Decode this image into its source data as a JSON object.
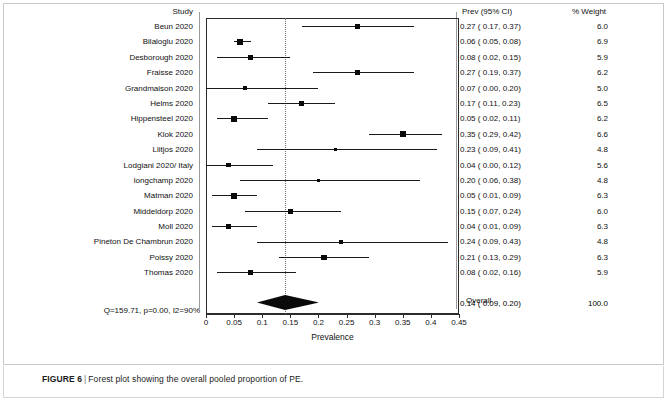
{
  "figure": {
    "caption_label": "FIGURE 6",
    "caption_separator": "|",
    "caption_text": "Forest plot showing the overall pooled proportion of PE."
  },
  "headers": {
    "study": "Study",
    "estimate": "Prev (95% CI)",
    "weight": "% Weight"
  },
  "overall": {
    "label": "Overall",
    "heterogeneity": "Q=159.71, p=0.00, I2=90%",
    "estimate_text": "0.14 (  0.09,  0.20)",
    "weight_text": "100.0"
  },
  "chart_data": {
    "type": "forest",
    "title": "Forest plot showing the overall pooled proportion of PE.",
    "xlabel": "Prevalence",
    "ylabel": "",
    "xlim": [
      0,
      0.45
    ],
    "xticks": [
      0,
      0.05,
      0.1,
      0.15,
      0.2,
      0.25,
      0.3,
      0.35,
      0.4,
      0.45
    ],
    "xticklabels": [
      "0",
      "0.05",
      "0.1",
      "0.15",
      "0.2",
      "0.25",
      "0.3",
      "0.35",
      "0.4",
      "0.45"
    ],
    "grid": false,
    "reference_line": 0.14,
    "effect_measure": "Prevalence",
    "studies": [
      {
        "label": "Beun 2020",
        "estimate": 0.27,
        "ci_low": 0.17,
        "ci_high": 0.37,
        "weight": 6.0,
        "estimate_text": "0.27 (  0.17,  0.37)",
        "weight_text": "6.0"
      },
      {
        "label": "Bilaloglu 2020",
        "estimate": 0.06,
        "ci_low": 0.05,
        "ci_high": 0.08,
        "weight": 6.9,
        "estimate_text": "0.06 (  0.05,  0.08)",
        "weight_text": "6.9"
      },
      {
        "label": "Desborough 2020",
        "estimate": 0.08,
        "ci_low": 0.02,
        "ci_high": 0.15,
        "weight": 5.9,
        "estimate_text": "0.08 (  0.02,  0.15)",
        "weight_text": "5.9"
      },
      {
        "label": "Fraisse 2020",
        "estimate": 0.27,
        "ci_low": 0.19,
        "ci_high": 0.37,
        "weight": 6.2,
        "estimate_text": "0.27 (  0.19,  0.37)",
        "weight_text": "6.2"
      },
      {
        "label": "Grandmaison 2020",
        "estimate": 0.07,
        "ci_low": 0.0,
        "ci_high": 0.2,
        "weight": 5.0,
        "estimate_text": "0.07 (  0.00,  0.20)",
        "weight_text": "5.0"
      },
      {
        "label": "Helms 2020",
        "estimate": 0.17,
        "ci_low": 0.11,
        "ci_high": 0.23,
        "weight": 6.5,
        "estimate_text": "0.17 (  0.11,  0.23)",
        "weight_text": "6.5"
      },
      {
        "label": "Hippensteel 2020",
        "estimate": 0.05,
        "ci_low": 0.02,
        "ci_high": 0.11,
        "weight": 6.2,
        "estimate_text": "0.05 (  0.02,  0.11)",
        "weight_text": "6.2"
      },
      {
        "label": "Klok 2020",
        "estimate": 0.35,
        "ci_low": 0.29,
        "ci_high": 0.42,
        "weight": 6.6,
        "estimate_text": "0.35 (  0.29,  0.42)",
        "weight_text": "6.6"
      },
      {
        "label": "Llitjos 2020",
        "estimate": 0.23,
        "ci_low": 0.09,
        "ci_high": 0.41,
        "weight": 4.8,
        "estimate_text": "0.23 (  0.09,  0.41)",
        "weight_text": "4.8"
      },
      {
        "label": "Lodgiani 2020/ Italy",
        "estimate": 0.04,
        "ci_low": 0.0,
        "ci_high": 0.12,
        "weight": 5.6,
        "estimate_text": "0.04 (  0.00,  0.12)",
        "weight_text": "5.6"
      },
      {
        "label": "longchamp 2020",
        "estimate": 0.2,
        "ci_low": 0.06,
        "ci_high": 0.38,
        "weight": 4.8,
        "estimate_text": "0.20 (  0.06,  0.38)",
        "weight_text": "4.8"
      },
      {
        "label": "Matman 2020",
        "estimate": 0.05,
        "ci_low": 0.01,
        "ci_high": 0.09,
        "weight": 6.3,
        "estimate_text": "0.05 (  0.01,  0.09)",
        "weight_text": "6.3"
      },
      {
        "label": "Middeldorp 2020",
        "estimate": 0.15,
        "ci_low": 0.07,
        "ci_high": 0.24,
        "weight": 6.0,
        "estimate_text": "0.15 (  0.07,  0.24)",
        "weight_text": "6.0"
      },
      {
        "label": "Moll 2020",
        "estimate": 0.04,
        "ci_low": 0.01,
        "ci_high": 0.09,
        "weight": 6.3,
        "estimate_text": "0.04 (  0.01,  0.09)",
        "weight_text": "6.3"
      },
      {
        "label": "Pineton De Chambrun 2020",
        "estimate": 0.24,
        "ci_low": 0.09,
        "ci_high": 0.43,
        "weight": 4.8,
        "estimate_text": "0.24 (  0.09,  0.43)",
        "weight_text": "4.8"
      },
      {
        "label": "Poissy 2020",
        "estimate": 0.21,
        "ci_low": 0.13,
        "ci_high": 0.29,
        "weight": 6.3,
        "estimate_text": "0.21 (  0.13,  0.29)",
        "weight_text": "6.3"
      },
      {
        "label": "Thomas 2020",
        "estimate": 0.08,
        "ci_low": 0.02,
        "ci_high": 0.16,
        "weight": 5.9,
        "estimate_text": "0.08 (  0.02,  0.16)",
        "weight_text": "5.9"
      }
    ],
    "summary": {
      "label": "Overall",
      "estimate": 0.14,
      "ci_low": 0.09,
      "ci_high": 0.2,
      "weight": 100.0,
      "estimate_text": "0.14 (  0.09,  0.20)",
      "weight_text": "100.0",
      "heterogeneity_text": "Q=159.71, p=0.00, I2=90%",
      "Q": 159.71,
      "p": 0.0,
      "I2": 90
    }
  },
  "colors": {
    "marker": "#0a0a0a",
    "line": "#1a1a1a",
    "axis": "#2b2b2b",
    "rule": "#9a9a9a",
    "null_line": "#6d6d6d",
    "frame": "#c9c9c9"
  }
}
